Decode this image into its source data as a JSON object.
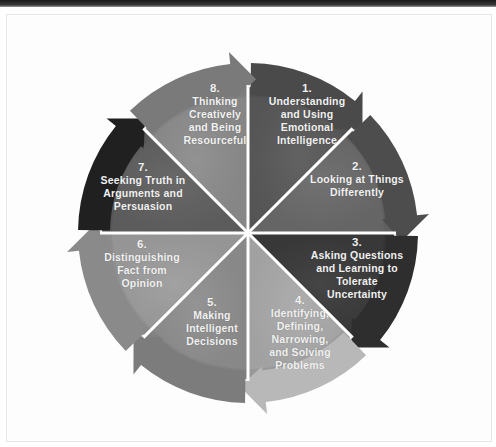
{
  "diagram": {
    "type": "cycle-wheel",
    "segments": [
      {
        "number": "1.",
        "text": "Understanding\nand Using\nEmotional\nIntelligence",
        "color": "#5a5a5a",
        "arrow_color": "#4a4a4a"
      },
      {
        "number": "2.",
        "text": "Looking at Things\nDifferently",
        "color": "#6a6a6a",
        "arrow_color": "#4d4d4d"
      },
      {
        "number": "3.",
        "text": "Asking Questions\nand Learning to\nTolerate\nUncertainty",
        "color": "#3b3b3b",
        "arrow_color": "#2e2e2e"
      },
      {
        "number": "4.",
        "text": "Identifying,\nDefining,\nNarrowing,\nand Solving\nProblems",
        "color": "#a9a9a9",
        "arrow_color": "#b8b8b8"
      },
      {
        "number": "5.",
        "text": "Making\nIntelligent\nDecisions",
        "color": "#8e8e8e",
        "arrow_color": "#7c7c7c"
      },
      {
        "number": "6.",
        "text": "Distinguishing\nFact from\nOpinion",
        "color": "#9c9c9c",
        "arrow_color": "#8a8a8a"
      },
      {
        "number": "7.",
        "text": "Seeking Truth in\nArguments and\nPersuasion",
        "color": "#606060",
        "arrow_color": "#202020"
      },
      {
        "number": "8.",
        "text": "Thinking\nCreatively\nand Being\nResourceful",
        "color": "#8c8c8c",
        "arrow_color": "#7a7a7a"
      }
    ]
  }
}
